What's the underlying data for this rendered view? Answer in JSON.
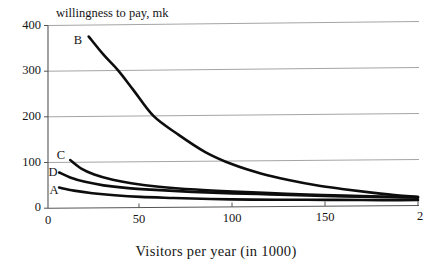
{
  "chart_data": {
    "type": "line",
    "title": "",
    "ylabel": "willingness to pay, mk",
    "xlabel": "Visitors per year (in 1000)",
    "xlim": [
      0,
      200
    ],
    "ylim": [
      0,
      400
    ],
    "xticks": [
      "0",
      "50",
      "100",
      "150",
      "2"
    ],
    "xtick_values": [
      0,
      50,
      100,
      150,
      200
    ],
    "yticks": [
      "0",
      "100",
      "200",
      "300",
      "400"
    ],
    "ytick_values": [
      0,
      100,
      200,
      300,
      400
    ],
    "grid": "horizontal",
    "legend": "inline-curve-labels",
    "series": [
      {
        "name": "B",
        "label": "B",
        "label_x": 22,
        "label_y": 398,
        "x": [
          22,
          30,
          38,
          46,
          57,
          70,
          85,
          100,
          115,
          130,
          145,
          160,
          175,
          190,
          200
        ],
        "y": [
          375,
          335,
          300,
          258,
          200,
          160,
          120,
          92,
          72,
          57,
          45,
          36,
          28,
          21,
          18
        ]
      },
      {
        "name": "C",
        "label": "C",
        "label_x": 7,
        "label_y": 118,
        "x": [
          12,
          18,
          25,
          35,
          45,
          60,
          80,
          100,
          120,
          140,
          160,
          180,
          200
        ],
        "y": [
          105,
          86,
          73,
          61,
          53,
          45,
          38,
          33,
          29,
          25,
          22,
          19,
          17
        ]
      },
      {
        "name": "D",
        "label": "D",
        "label_x": 4,
        "label_y": 88,
        "x": [
          6,
          12,
          20,
          30,
          42,
          58,
          78,
          100,
          120,
          140,
          160,
          180,
          200
        ],
        "y": [
          78,
          67,
          57,
          49,
          43,
          38,
          33,
          29,
          26,
          23,
          20,
          18,
          16
        ]
      },
      {
        "name": "A",
        "label": "A",
        "label_x": 5,
        "label_y": 46,
        "x": [
          6,
          14,
          24,
          36,
          50,
          68,
          88,
          110,
          130,
          150,
          170,
          185,
          200
        ],
        "y": [
          45,
          38,
          32,
          27,
          23,
          20,
          17,
          15,
          14,
          13,
          12,
          11,
          11
        ]
      }
    ],
    "colors": {
      "curve": "#0d0d0d",
      "gridline": "#9a9a9a",
      "axis": "#555555",
      "text": "#151515",
      "background": "#ffffff"
    }
  }
}
